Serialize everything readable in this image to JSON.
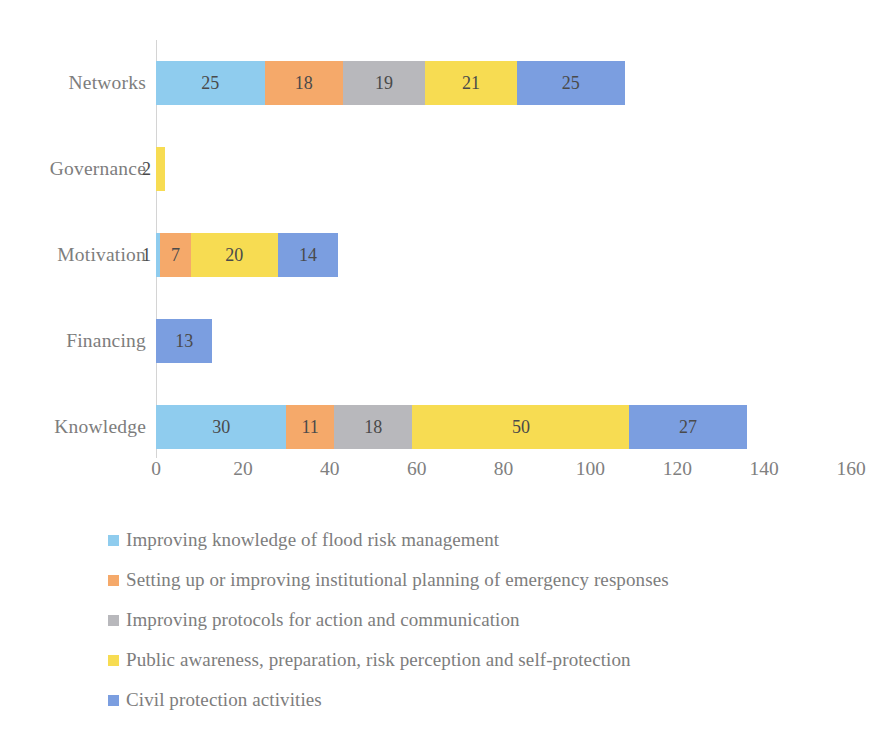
{
  "chart_data": {
    "type": "bar",
    "orientation": "horizontal",
    "stacked": true,
    "title": "",
    "xlabel": "",
    "ylabel": "",
    "xlim": [
      0,
      160
    ],
    "xticks": [
      "0",
      "20",
      "40",
      "60",
      "80",
      "100",
      "120",
      "140",
      "160"
    ],
    "xtick_values": [
      0,
      20,
      40,
      60,
      80,
      100,
      120,
      140,
      160
    ],
    "grid": false,
    "legend_position": "bottom-left",
    "categories": [
      "Networks",
      "Governance",
      "Motivation",
      "Financing",
      "Knowledge"
    ],
    "series": [
      {
        "name": "Improving knowledge of flood risk management",
        "color": "#8FCCEE",
        "values": [
          25,
          0,
          1,
          0,
          30
        ]
      },
      {
        "name": "Setting up or improving institutional planning of emergency responses",
        "color": "#F5A96A",
        "values": [
          18,
          0,
          7,
          0,
          11
        ]
      },
      {
        "name": "Improving protocols for action and communication",
        "color": "#B8B8BC",
        "values": [
          19,
          0,
          0,
          0,
          18
        ]
      },
      {
        "name": "Public awareness, preparation, risk perception and self-protection",
        "color": "#F7DC52",
        "values": [
          21,
          2,
          20,
          0,
          50
        ]
      },
      {
        "name": "Civil protection activities",
        "color": "#7B9EE0",
        "values": [
          25,
          0,
          14,
          13,
          27
        ]
      }
    ],
    "totals": [
      108,
      2,
      42,
      13,
      136
    ]
  },
  "legend": {
    "items": [
      {
        "label": "Improving knowledge of flood risk management",
        "color": "#8FCCEE"
      },
      {
        "label": "Setting up or improving institutional planning of emergency responses",
        "color": "#F5A96A"
      },
      {
        "label": "Improving protocols for action and communication",
        "color": "#B8B8BC"
      },
      {
        "label": "Public awareness, preparation, risk perception and self-protection",
        "color": "#F7DC52"
      },
      {
        "label": "Civil protection activities",
        "color": "#7B9EE0"
      }
    ]
  }
}
